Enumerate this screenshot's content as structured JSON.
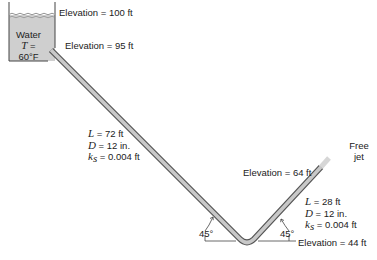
{
  "figure": {
    "type": "pipe-flow-diagram",
    "tank": {
      "fluid_label": "Water",
      "temp_symbol": "T",
      "temp_eq": "=",
      "temp_value": "60°F",
      "surface_elevation": "Elevation = 100 ft",
      "outlet_elevation": "Elevation = 95 ft"
    },
    "pipe1": {
      "L_sym": "L",
      "L_val": "= 72 ft",
      "D_sym": "D",
      "D_val": "= 12 in.",
      "k_sym": "k",
      "k_sub": "s",
      "k_val": "= 0.004 ft"
    },
    "pipe2": {
      "L_sym": "L",
      "L_val": "= 28 ft",
      "D_sym": "D",
      "D_val": "= 12 in.",
      "k_sym": "k",
      "k_sub": "s",
      "k_val": "= 0.004 ft"
    },
    "outlet": {
      "jet_label_line1": "Free",
      "jet_label_line2": "jet",
      "elevation": "Elevation = 64 ft"
    },
    "bend": {
      "elevation": "Elevation = 44 ft",
      "angle_left": "45°",
      "angle_right": "45°"
    },
    "colors": {
      "tank_fill": "#cfcfcf",
      "pipe_fill": "#c8c8c8",
      "pipe_outline": "#555555",
      "jet": "#d6d6d6"
    }
  }
}
